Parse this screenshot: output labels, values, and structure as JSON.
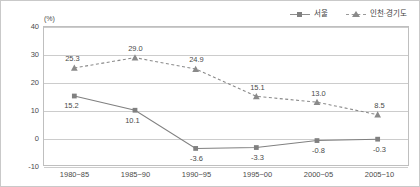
{
  "chart_data": {
    "type": "line",
    "title": "",
    "xlabel": "",
    "ylabel": "",
    "yunit": "(%)",
    "ylim": [
      -10,
      40
    ],
    "yticks": [
      40,
      30,
      20,
      10,
      0,
      -10
    ],
    "ytick_labels": [
      "40",
      "30",
      "20",
      "10",
      "0",
      "-10"
    ],
    "grid": true,
    "legend_position": "top-right",
    "categories": [
      "1980~85",
      "1985~90",
      "1990~95",
      "1995~00",
      "2000~05",
      "2005~10"
    ],
    "series": [
      {
        "name": "서울",
        "marker": "square",
        "linestyle": "solid",
        "color": "#808080",
        "values": [
          15.2,
          10.1,
          -3.6,
          -3.3,
          -0.8,
          -0.3
        ],
        "labels": [
          "15.2",
          "10.1",
          "-3.6",
          "-3.3",
          "-0.8",
          "-0.3"
        ]
      },
      {
        "name": "인천·경기도",
        "marker": "triangle",
        "linestyle": "dashed",
        "color": "#8a8a8a",
        "values": [
          25.3,
          29.0,
          24.9,
          15.1,
          13.0,
          8.5
        ],
        "labels": [
          "25.3",
          "29.0",
          "24.9",
          "15.1",
          "13.0",
          "8.5"
        ]
      }
    ]
  },
  "colors": {
    "grid": "#cccccc",
    "border": "#bfbfbf",
    "text": "#4a4a4a",
    "series_solid": "#808080",
    "series_dashed": "#8a8a8a"
  }
}
